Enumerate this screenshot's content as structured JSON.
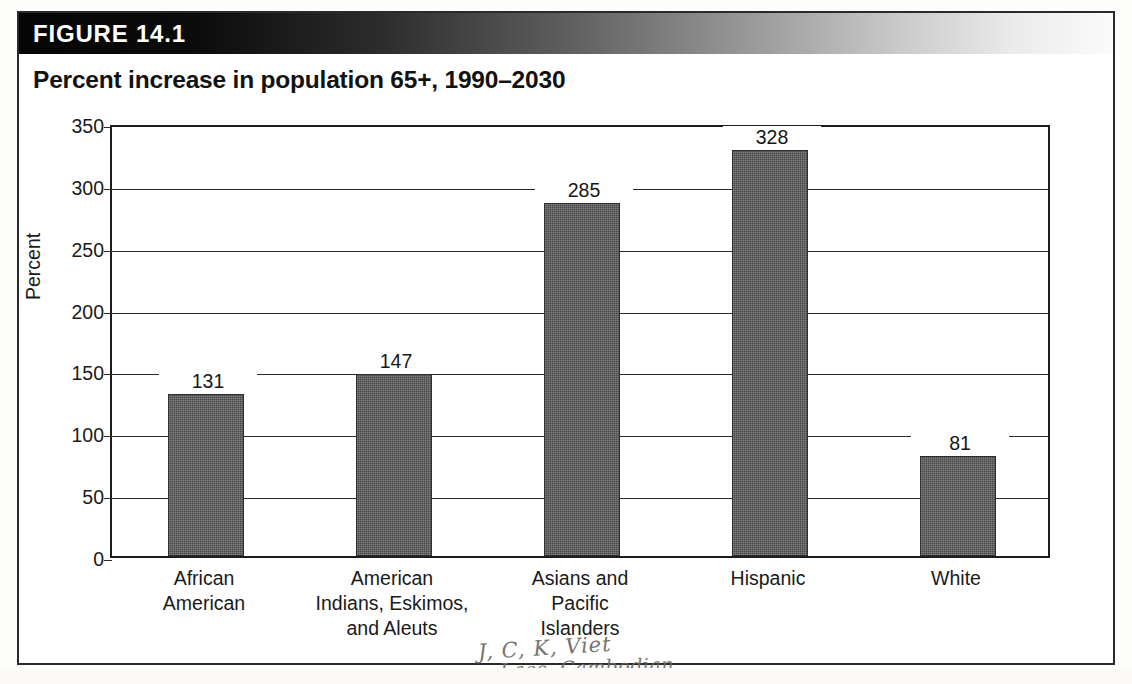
{
  "figure": {
    "header_label": "FIGURE 14.1",
    "title": "Percent increase in population 65+, 1990–2030"
  },
  "annotation": {
    "line1": "J, C, K, Viet",
    "line2": "Laos, Cambodian"
  },
  "chart_data": {
    "type": "bar",
    "title": "Percent increase in population 65+, 1990–2030",
    "xlabel": "",
    "ylabel": "Percent",
    "ylim": [
      0,
      350
    ],
    "yticks": [
      0,
      50,
      100,
      150,
      200,
      250,
      300,
      350
    ],
    "ytick_labels": [
      "0",
      "50",
      "100",
      "150",
      "200",
      "250",
      "300",
      "350"
    ],
    "grid": true,
    "legend": false,
    "bar_color": "#474747",
    "categories": [
      "African American",
      "American Indians, Eskimos, and Aleuts",
      "Asians and Pacific Islanders",
      "Hispanic",
      "White"
    ],
    "category_lines": [
      [
        "African",
        "American"
      ],
      [
        "American",
        "Indians, Eskimos,",
        "and Aleuts"
      ],
      [
        "Asians and",
        "Pacific",
        "Islanders"
      ],
      [
        "Hispanic"
      ],
      [
        "White"
      ]
    ],
    "values": [
      131,
      147,
      285,
      328,
      81
    ],
    "value_labels": [
      "131",
      "147",
      "285",
      "328",
      "81"
    ]
  }
}
